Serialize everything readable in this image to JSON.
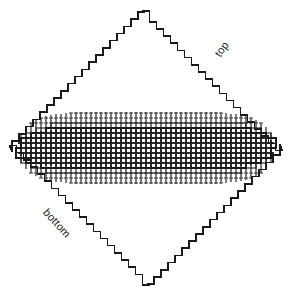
{
  "figure": {
    "background_color": "#ffffff",
    "stroke_color": "#1a1a1a",
    "faint_stroke_color": "#4a4a4a",
    "width": 292,
    "height": 295
  },
  "labels": {
    "top": "top",
    "bottom": "bottom"
  },
  "chart_data": {
    "type": "diagram",
    "annotations": [
      {
        "text": "top",
        "edge": "upper-right",
        "rotation_deg": -55,
        "x": 212,
        "y": 52
      },
      {
        "text": "bottom",
        "edge": "lower-left",
        "rotation_deg": 48,
        "x": 50,
        "y": 206
      }
    ],
    "diamond": {
      "center_x": 146,
      "center_y": 148,
      "half_width": 134,
      "half_height": 137,
      "step_px": 7,
      "stroke_width": 1.6
    },
    "grid_band": {
      "center_y": 148,
      "solid_half_height": 20,
      "faint_half_height": 36,
      "lens_half_width": 130,
      "vertical_line_spacing": 5,
      "horizontal_line_spacing": 5,
      "tick_spacing": 5
    },
    "xlabel": "",
    "ylabel": "",
    "grid": true,
    "legend": "none"
  }
}
